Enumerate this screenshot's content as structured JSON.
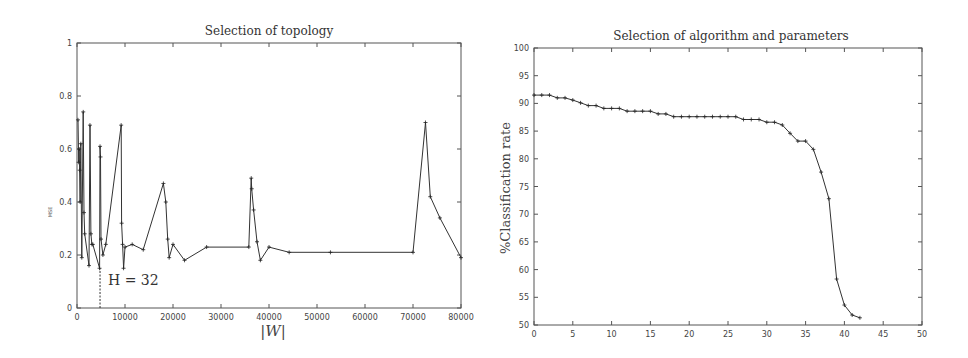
{
  "chart_data": [
    {
      "type": "line",
      "title": "Selection of topology",
      "xlabel": "|W|",
      "ylabel": "MSE",
      "xlim": [
        0,
        80000
      ],
      "ylim": [
        0,
        1
      ],
      "xticks": [
        "0",
        "10000",
        "20000",
        "30000",
        "40000",
        "50000",
        "60000",
        "70000",
        "80000"
      ],
      "yticks": [
        "0",
        "0.2",
        "0.4",
        "0.6",
        "0.8",
        "1"
      ],
      "grid": false,
      "legend": null,
      "annotation": {
        "text": "H = 32",
        "x": 4800,
        "dashed_line_from_y": 0,
        "dashed_line_to_y": 0.15
      },
      "x": [
        200,
        350,
        450,
        550,
        650,
        800,
        1000,
        1300,
        1450,
        1600,
        2500,
        2700,
        2900,
        3100,
        3300,
        4700,
        4800,
        4900,
        5000,
        5400,
        6000,
        9200,
        9300,
        9500,
        9700,
        10000,
        11500,
        13800,
        18000,
        18500,
        18900,
        19200,
        20000,
        22400,
        27000,
        35800,
        36300,
        36400,
        36800,
        37500,
        38200,
        40000,
        44200,
        52800,
        70000,
        72600,
        73600,
        75600,
        80000
      ],
      "values": [
        0.71,
        0.55,
        0.6,
        0.52,
        0.4,
        0.62,
        0.19,
        0.74,
        0.36,
        0.28,
        0.16,
        0.69,
        0.28,
        0.24,
        0.24,
        0.15,
        0.61,
        0.57,
        0.26,
        0.2,
        0.24,
        0.69,
        0.32,
        0.24,
        0.15,
        0.23,
        0.24,
        0.22,
        0.47,
        0.4,
        0.26,
        0.19,
        0.24,
        0.18,
        0.23,
        0.23,
        0.49,
        0.45,
        0.37,
        0.25,
        0.18,
        0.23,
        0.21,
        0.21,
        0.21,
        0.7,
        0.42,
        0.34,
        0.19
      ]
    },
    {
      "type": "line",
      "title": "Selection of algorithm and parameters",
      "xlabel": "",
      "ylabel": "%Classification rate",
      "xlim": [
        0,
        50
      ],
      "ylim": [
        50,
        100
      ],
      "xticks": [
        "0",
        "5",
        "10",
        "15",
        "20",
        "25",
        "30",
        "35",
        "40",
        "45",
        "50"
      ],
      "yticks": [
        "50",
        "55",
        "60",
        "65",
        "70",
        "75",
        "80",
        "85",
        "90",
        "95",
        "100"
      ],
      "grid": false,
      "legend": null,
      "x": [
        0,
        1,
        2,
        3,
        4,
        5,
        6,
        7,
        8,
        9,
        10,
        11,
        12,
        13,
        14,
        15,
        16,
        17,
        18,
        19,
        20,
        21,
        22,
        23,
        24,
        25,
        26,
        27,
        28,
        29,
        30,
        31,
        32,
        33,
        34,
        35,
        36,
        37,
        38,
        39,
        40,
        41,
        42
      ],
      "values": [
        91.5,
        91.5,
        91.5,
        91.0,
        91.0,
        90.6,
        90.1,
        89.6,
        89.6,
        89.1,
        89.1,
        89.1,
        88.6,
        88.6,
        88.6,
        88.6,
        88.1,
        88.1,
        87.6,
        87.6,
        87.6,
        87.6,
        87.6,
        87.6,
        87.6,
        87.6,
        87.6,
        87.1,
        87.1,
        87.1,
        86.6,
        86.6,
        86.1,
        84.6,
        83.2,
        83.2,
        81.7,
        77.6,
        72.8,
        58.3,
        53.6,
        51.8,
        51.3
      ]
    }
  ]
}
